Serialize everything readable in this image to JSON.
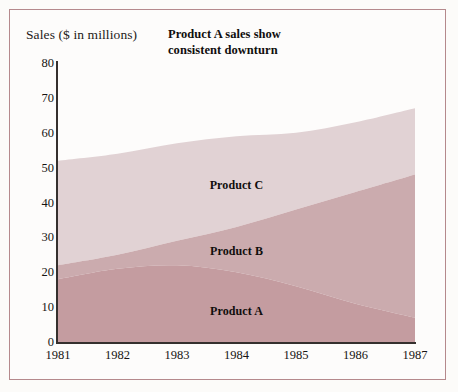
{
  "figure": {
    "title": "Product A sales show\nconsistent downturn",
    "y_axis_title": "Sales ($ in millions)",
    "frame_color": "#b5898c",
    "background_color": "#fdfcfb"
  },
  "chart_data": {
    "type": "area",
    "stacked": true,
    "title": "Product A sales show consistent downturn",
    "xlabel": "",
    "ylabel": "Sales ($ in millions)",
    "categories": [
      "1981",
      "1982",
      "1983",
      "1984",
      "1985",
      "1986",
      "1987"
    ],
    "x": [
      1981,
      1982,
      1983,
      1984,
      1985,
      1986,
      1987
    ],
    "ylim": [
      0,
      80
    ],
    "xlim": [
      1981,
      1987
    ],
    "yticks": [
      0,
      10,
      20,
      30,
      40,
      50,
      60,
      70,
      80
    ],
    "ytick_labels": [
      "0",
      "10",
      "20",
      "30",
      "40",
      "50",
      "60",
      "70",
      "80"
    ],
    "xtick_labels": [
      "1981",
      "1982",
      "1983",
      "1984",
      "1985",
      "1986",
      "1987"
    ],
    "grid": false,
    "legend": "inline-labels",
    "series": [
      {
        "name": "Product A",
        "color": "#c49ca0",
        "values": [
          18,
          21,
          22,
          20,
          16,
          11,
          7
        ],
        "cumulative": [
          18,
          21,
          22,
          20,
          16,
          11,
          7
        ]
      },
      {
        "name": "Product B",
        "color": "#cbabae",
        "values": [
          4,
          4,
          7,
          13,
          22,
          32,
          41
        ],
        "cumulative": [
          22,
          25,
          29,
          33,
          38,
          43,
          48
        ]
      },
      {
        "name": "Product C",
        "color": "#e1d2d4",
        "values": [
          30,
          29,
          28,
          26,
          22,
          20,
          19
        ],
        "cumulative": [
          52,
          54,
          57,
          59,
          60,
          63,
          67
        ]
      }
    ],
    "annotations": [
      {
        "text": "Product C",
        "x": 1984,
        "y": 45
      },
      {
        "text": "Product B",
        "x": 1984,
        "y": 26
      },
      {
        "text": "Product A",
        "x": 1984,
        "y": 9
      }
    ]
  }
}
